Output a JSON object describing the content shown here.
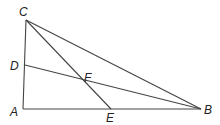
{
  "diagram": {
    "points": {
      "A": {
        "label": "A",
        "x": 23,
        "y": 109
      },
      "B": {
        "label": "B",
        "x": 201,
        "y": 109
      },
      "C": {
        "label": "C",
        "x": 26,
        "y": 20
      },
      "D": {
        "label": "D",
        "x": 25,
        "y": 65
      },
      "E": {
        "label": "E",
        "x": 111,
        "y": 109
      },
      "F": {
        "label": "F",
        "x": 82,
        "y": 90
      }
    },
    "segments": [
      "AB",
      "AC",
      "CB",
      "CE",
      "DB"
    ]
  }
}
